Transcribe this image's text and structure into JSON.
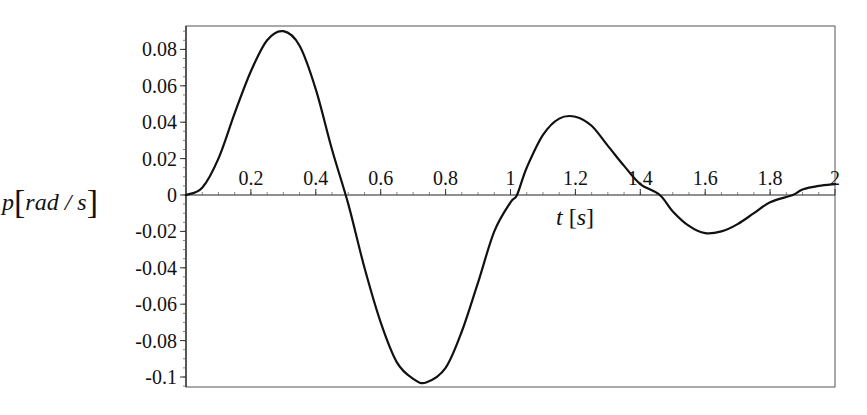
{
  "chart_data": {
    "type": "line",
    "title": "",
    "xlabel": "t [s]",
    "ylabel": "p [rad / s]",
    "xlabel_parts": {
      "var": "t",
      "unit": "s"
    },
    "ylabel_parts": {
      "var": "p",
      "unit": "rad / s"
    },
    "xlim": [
      0,
      2
    ],
    "ylim": [
      -0.105,
      0.092
    ],
    "grid": false,
    "legend": null,
    "x_ticks": [
      0.2,
      0.4,
      0.6,
      0.8,
      1,
      1.2,
      1.4,
      1.6,
      1.8,
      2
    ],
    "x_tick_labels": [
      "0.2",
      "0.4",
      "0.6",
      "0.8",
      "1",
      "1.2",
      "1.4",
      "1.6",
      "1.8",
      "2"
    ],
    "y_ticks": [
      0.08,
      0.06,
      0.04,
      0.02,
      0,
      -0.02,
      -0.04,
      -0.06,
      -0.08,
      -0.1
    ],
    "y_tick_labels": [
      "0.08",
      "0.06",
      "0.04",
      "0.02",
      "0",
      "-0.02",
      "-0.04",
      "-0.06",
      "-0.08",
      "-0.1"
    ],
    "series": [
      {
        "name": "p(t)",
        "color": "#111111",
        "x": [
          0.0,
          0.05,
          0.1,
          0.15,
          0.2,
          0.25,
          0.3,
          0.35,
          0.4,
          0.45,
          0.5,
          0.55,
          0.6,
          0.65,
          0.7,
          0.74,
          0.8,
          0.85,
          0.9,
          0.95,
          1.0,
          1.02,
          1.05,
          1.1,
          1.15,
          1.2,
          1.25,
          1.3,
          1.35,
          1.4,
          1.46,
          1.5,
          1.55,
          1.6,
          1.65,
          1.7,
          1.75,
          1.8,
          1.87,
          1.9,
          1.95,
          2.0
        ],
        "y": [
          0.0,
          0.004,
          0.02,
          0.045,
          0.068,
          0.085,
          0.09,
          0.082,
          0.058,
          0.025,
          -0.005,
          -0.04,
          -0.07,
          -0.092,
          -0.101,
          -0.103,
          -0.095,
          -0.075,
          -0.048,
          -0.02,
          -0.004,
          0.0,
          0.015,
          0.033,
          0.042,
          0.043,
          0.038,
          0.027,
          0.016,
          0.006,
          0.0,
          -0.009,
          -0.017,
          -0.021,
          -0.02,
          -0.016,
          -0.01,
          -0.004,
          0.0,
          0.003,
          0.005,
          0.006
        ]
      }
    ]
  }
}
